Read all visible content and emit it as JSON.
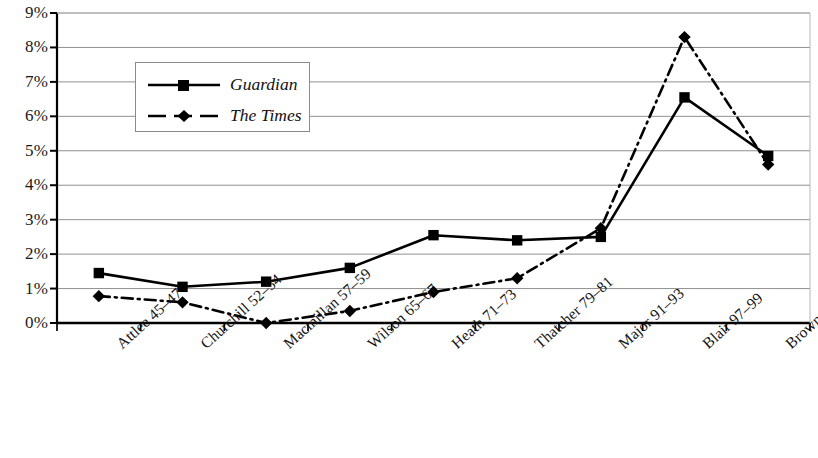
{
  "chart_data": {
    "type": "line",
    "title": "",
    "xlabel": "",
    "ylabel": "",
    "ylim": [
      0,
      9
    ],
    "ytick_labels": [
      "9%",
      "8%",
      "7%",
      "6%",
      "5%",
      "4%",
      "3%",
      "2%",
      "1%",
      "0%"
    ],
    "ytick_values": [
      9,
      8,
      7,
      6,
      5,
      4,
      3,
      2,
      1,
      0
    ],
    "grid": true,
    "legend_position": "upper-left",
    "categories": [
      "Attlee 45–47",
      "Churchill 52–54",
      "Macmillan 57–59",
      "Wilson 65–67",
      "Heath 71–73",
      "Thatcher 79–81",
      "Major 91–93",
      "Blair 97–99",
      "Brown 07–09"
    ],
    "series": [
      {
        "name": "Guardian",
        "marker": "square",
        "linestyle": "solid",
        "color": "#000000",
        "values": [
          1.45,
          1.05,
          1.2,
          1.6,
          2.55,
          2.4,
          2.5,
          6.55,
          4.85
        ]
      },
      {
        "name": "The Times",
        "marker": "diamond",
        "linestyle": "dashdot",
        "color": "#000000",
        "values": [
          0.78,
          0.6,
          0.0,
          0.35,
          0.9,
          1.3,
          2.75,
          8.3,
          4.6
        ]
      }
    ]
  },
  "legend": {
    "entries": [
      {
        "label": "Guardian"
      },
      {
        "label": "The Times"
      }
    ]
  }
}
